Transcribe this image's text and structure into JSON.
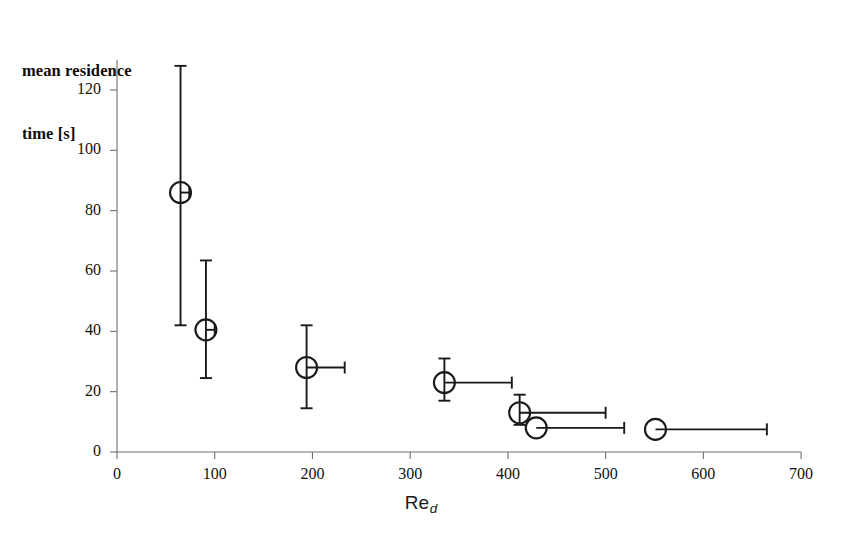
{
  "figure": {
    "width": 842,
    "height": 540,
    "background": "#ffffff",
    "axis_color": "#6e6e6e",
    "marker_color": "#1a1a1a",
    "errorbar_color": "#1a1a1a"
  },
  "labels": {
    "ylabel_line1": "mean residence",
    "ylabel_line2": "time [s]",
    "xlabel_main": "Re",
    "xlabel_sub": "d"
  },
  "chart_data": {
    "type": "scatter",
    "title": "",
    "xlabel": "Re_d",
    "ylabel": "mean residence time [s]",
    "xlim": [
      0,
      700
    ],
    "ylim": [
      0,
      130
    ],
    "xticks": [
      0,
      100,
      200,
      300,
      400,
      500,
      600,
      700
    ],
    "yticks": [
      0,
      20,
      40,
      60,
      80,
      100,
      120
    ],
    "xtick_labels": [
      "0",
      "100",
      "200",
      "300",
      "400",
      "500",
      "600",
      "700"
    ],
    "ytick_labels": [
      "0",
      "20",
      "40",
      "60",
      "80",
      "100",
      "120"
    ],
    "grid": false,
    "legend": "none",
    "marker": "open-circle",
    "series": [
      {
        "name": "mean residence time",
        "points": [
          {
            "x": 65,
            "y": 86,
            "yerr_low": 44,
            "yerr_high": 42,
            "xerr_low": 0,
            "xerr_high": 9
          },
          {
            "x": 91,
            "y": 40.5,
            "yerr_low": 16,
            "yerr_high": 23,
            "xerr_low": 0,
            "xerr_high": 9
          },
          {
            "x": 194,
            "y": 28,
            "yerr_low": 13.5,
            "yerr_high": 14,
            "xerr_low": 0,
            "xerr_high": 39
          },
          {
            "x": 335,
            "y": 23,
            "yerr_low": 6,
            "yerr_high": 8,
            "xerr_low": 0,
            "xerr_high": 69
          },
          {
            "x": 412,
            "y": 13,
            "yerr_low": 4,
            "yerr_high": 6,
            "xerr_low": 0,
            "xerr_high": 88
          },
          {
            "x": 429,
            "y": 8,
            "yerr_low": 0,
            "yerr_high": 0,
            "xerr_low": 0,
            "xerr_high": 90
          },
          {
            "x": 551,
            "y": 7.5,
            "yerr_low": 0,
            "yerr_high": 0,
            "xerr_low": 0,
            "xerr_high": 114
          }
        ]
      }
    ]
  }
}
